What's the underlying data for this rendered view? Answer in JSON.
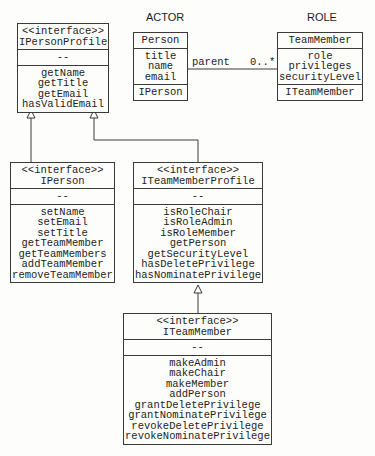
{
  "headers": {
    "actor": "ACTOR",
    "role": "ROLE"
  },
  "association": {
    "label": "parent",
    "multiplicity": "0..*"
  },
  "boxes": {
    "ipersonprofile": {
      "stereotype": "<<interface>>",
      "name": "IPersonProfile",
      "attributes": [
        "--"
      ],
      "methods": [
        "getName",
        "getTitle",
        "getEmail",
        "hasValidEmail"
      ]
    },
    "person": {
      "name": "Person",
      "attributes": [
        "title",
        "name",
        "email"
      ],
      "interface": "IPerson"
    },
    "teammember": {
      "name": "TeamMember",
      "attributes": [
        "role",
        "privileges",
        "securityLevel"
      ],
      "interface": "ITeamMember"
    },
    "iperson": {
      "stereotype": "<<interface>>",
      "name": "IPerson",
      "attributes": [
        "--"
      ],
      "methods": [
        "setName",
        "setEmail",
        "setTitle",
        "getTeamMember",
        "getTeamMembers",
        "addTeamMember",
        "removeTeamMember"
      ]
    },
    "iteammemberprofile": {
      "stereotype": "<<interface>>",
      "name": "ITeamMemberProfile",
      "attributes": [
        "--"
      ],
      "methods": [
        "isRoleChair",
        "isRoleAdmin",
        "isRoleMember",
        "getPerson",
        "getSecurityLevel",
        "hasDeletePrivilege",
        "hasNominatePrivilege"
      ]
    },
    "iteammember": {
      "stereotype": "<<interface>>",
      "name": "ITeamMember",
      "attributes": [
        "--"
      ],
      "methods": [
        "makeAdmin",
        "makeChair",
        "makeMember",
        "addPerson",
        "grantDeletePrivilege",
        "grantNominatePrivilege",
        "revokeDeletePrivilege",
        "revokeNominatePrivilege"
      ]
    }
  }
}
